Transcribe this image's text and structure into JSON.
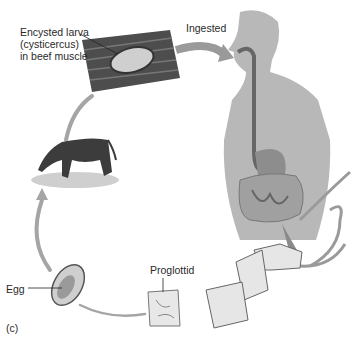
{
  "panel_label": "(c)",
  "labels": {
    "larva_line1": "Encysted larva",
    "larva_line2": "(cysticercus)",
    "larva_line3": "in beef muscle",
    "ingested": "Ingested",
    "proglottid": "Proglottid",
    "egg": "Egg"
  },
  "stages": [
    "Encysted larva in beef muscle",
    "Ingested by human",
    "Adult tapeworm in intestine",
    "Proglottid",
    "Egg",
    "Cow grazing"
  ],
  "colors": {
    "arrow": "#9a9a9a",
    "body": "#b8b8b8",
    "muscle": "#4a4a4a",
    "text": "#2a2a2a"
  }
}
